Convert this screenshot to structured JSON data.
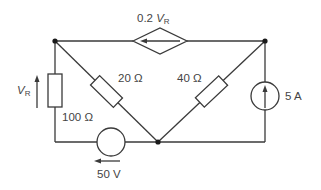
{
  "diagram": {
    "type": "circuit",
    "colors": {
      "stroke": "#3a3a3a",
      "text": "#444444",
      "background": "#ffffff"
    },
    "components": {
      "dependent_source": {
        "label_coef": "0.2 ",
        "label_var": "V",
        "label_sub": "R",
        "kind": "dependent current source (diamond)",
        "direction": "left"
      },
      "resistor_left": {
        "label": "100 Ω",
        "value_ohms": 100
      },
      "voltage_label": {
        "var": "V",
        "sub": "R",
        "direction": "up"
      },
      "resistor_20": {
        "label": "20 Ω",
        "value_ohms": 20
      },
      "resistor_40": {
        "label": "40 Ω",
        "value_ohms": 40
      },
      "current_source": {
        "label": "5 A",
        "value_amps": 5,
        "direction": "up"
      },
      "voltage_source": {
        "label": "50 V",
        "value_volts": 50,
        "direction": "left"
      }
    },
    "nodes": [
      "top-left",
      "top-right",
      "bottom-center"
    ]
  }
}
